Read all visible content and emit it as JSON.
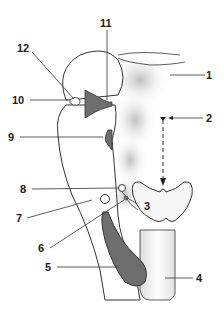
{
  "diagram": {
    "title": "",
    "labels": [
      {
        "id": "1",
        "text": "1"
      },
      {
        "id": "2",
        "text": "2"
      },
      {
        "id": "3",
        "text": "3"
      },
      {
        "id": "4",
        "text": "4"
      },
      {
        "id": "5",
        "text": "5"
      },
      {
        "id": "6",
        "text": "6"
      },
      {
        "id": "7",
        "text": "7"
      },
      {
        "id": "8",
        "text": "8"
      },
      {
        "id": "9",
        "text": "9"
      },
      {
        "id": "10",
        "text": "10"
      },
      {
        "id": "11",
        "text": "11"
      },
      {
        "id": "12",
        "text": "12"
      }
    ],
    "colors": {
      "outline": "#333333",
      "dark_fill": "#6e6e6e",
      "shade": "#cfcfcf",
      "background": "#ffffff"
    }
  }
}
